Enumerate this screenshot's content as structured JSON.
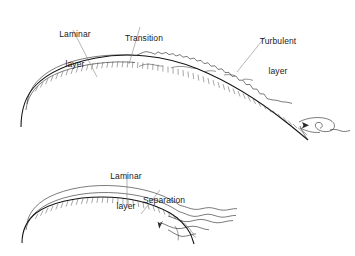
{
  "figure": {
    "background_color": "#ffffff",
    "line_color": "#2b2b2b",
    "leader_color": "#7a7a7a",
    "width": 355,
    "height": 256
  },
  "diagrams": [
    {
      "name": "attached-boundary-layer-diagram",
      "labels": [
        {
          "name": "laminar-layer-label",
          "line1": "Laminar",
          "line2": "layer",
          "x": 50,
          "y": 9,
          "width": 50
        },
        {
          "name": "transition-label",
          "line1": "Transition",
          "line2": "",
          "x": 118,
          "y": 13,
          "width": 52
        },
        {
          "name": "turbulent-layer-label",
          "line1": "Turbulent",
          "line2": "layer",
          "x": 253,
          "y": 16,
          "width": 50
        }
      ],
      "features": [
        "laminar boundary layer",
        "transition point",
        "turbulent boundary layer",
        "trailing edge recirculation vortex"
      ]
    },
    {
      "name": "separated-boundary-layer-diagram",
      "labels": [
        {
          "name": "laminar-layer-label-lower",
          "line1": "Laminar",
          "line2": "layer",
          "x": 101,
          "y": 151,
          "width": 50
        },
        {
          "name": "separation-label",
          "line1": "Separation",
          "line2": "",
          "x": 143,
          "y": 175,
          "width": 52
        }
      ],
      "features": [
        "laminar boundary layer",
        "separation point",
        "separated shear layer with reverse flow arrow"
      ]
    }
  ]
}
